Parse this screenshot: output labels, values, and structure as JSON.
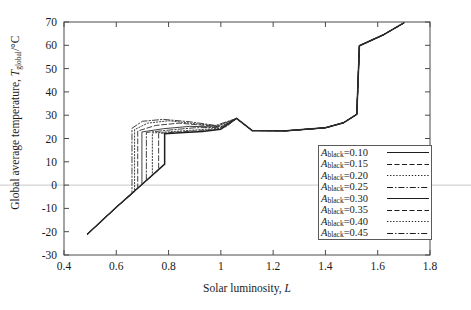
{
  "chart_data": {
    "type": "line",
    "title": "",
    "xlabel": "Solar luminosity, L",
    "ylabel": "Global average temperature, T_global/°C",
    "xlim": [
      0.4,
      1.8
    ],
    "ylim": [
      -30,
      70
    ],
    "xticks": [
      "0.4",
      "0.6",
      "0.8",
      "1",
      "1.2",
      "1.4",
      "1.6",
      "1.8"
    ],
    "xtick_values": [
      0.4,
      0.6,
      0.8,
      1.0,
      1.2,
      1.4,
      1.6,
      1.8
    ],
    "yticks": [
      "70",
      "60",
      "50",
      "40",
      "30",
      "20",
      "10",
      "0",
      "-10",
      "-20",
      "-30"
    ],
    "ytick_values": [
      70,
      60,
      50,
      40,
      30,
      20,
      10,
      0,
      -10,
      -20,
      -30
    ],
    "grid": false,
    "legend_position": "lower-right",
    "zero_reference_line": 0,
    "series": [
      {
        "name": "A_black=0.10",
        "label_prefix": "A",
        "label_subscript": "black",
        "label_value": "0.10",
        "dash": "solid",
        "jump_L": 0.785,
        "points": [
          [
            0.49,
            -21.0
          ],
          [
            0.6,
            -9.5
          ],
          [
            0.7,
            0.5
          ],
          [
            0.785,
            9.0
          ],
          [
            0.785,
            22.0
          ],
          [
            0.86,
            22.6
          ],
          [
            0.93,
            23.0
          ],
          [
            1.0,
            24.0
          ],
          [
            1.06,
            28.6
          ],
          [
            1.12,
            23.4
          ],
          [
            1.25,
            23.3
          ],
          [
            1.4,
            24.6
          ],
          [
            1.47,
            26.8
          ],
          [
            1.52,
            30.4
          ],
          [
            1.53,
            59.8
          ],
          [
            1.62,
            64.4
          ],
          [
            1.7,
            69.6
          ]
        ]
      },
      {
        "name": "A_black=0.15",
        "label_prefix": "A",
        "label_subscript": "black",
        "label_value": "0.15",
        "dash": "dashed",
        "jump_L": 0.762,
        "points": [
          [
            0.49,
            -21.0
          ],
          [
            0.6,
            -9.5
          ],
          [
            0.7,
            0.5
          ],
          [
            0.762,
            6.5
          ],
          [
            0.762,
            22.2
          ],
          [
            0.84,
            22.8
          ],
          [
            0.93,
            23.4
          ],
          [
            1.0,
            24.2
          ],
          [
            1.06,
            28.6
          ],
          [
            1.12,
            23.4
          ],
          [
            1.25,
            23.3
          ],
          [
            1.4,
            24.6
          ],
          [
            1.47,
            26.8
          ],
          [
            1.52,
            30.4
          ],
          [
            1.53,
            59.8
          ],
          [
            1.62,
            64.4
          ],
          [
            1.7,
            69.6
          ]
        ]
      },
      {
        "name": "A_black=0.20",
        "label_prefix": "A",
        "label_subscript": "black",
        "label_value": "0.20",
        "dash": "dotted",
        "jump_L": 0.738,
        "points": [
          [
            0.49,
            -21.0
          ],
          [
            0.6,
            -9.5
          ],
          [
            0.7,
            0.5
          ],
          [
            0.738,
            4.0
          ],
          [
            0.738,
            22.4
          ],
          [
            0.82,
            23.0
          ],
          [
            0.92,
            23.8
          ],
          [
            1.0,
            24.4
          ],
          [
            1.06,
            28.6
          ],
          [
            1.12,
            23.4
          ],
          [
            1.25,
            23.3
          ],
          [
            1.4,
            24.6
          ],
          [
            1.47,
            26.8
          ],
          [
            1.52,
            30.4
          ],
          [
            1.53,
            59.8
          ],
          [
            1.62,
            64.4
          ],
          [
            1.7,
            69.6
          ]
        ]
      },
      {
        "name": "A_black=0.25",
        "label_prefix": "A",
        "label_subscript": "black",
        "label_value": "0.25",
        "dash": "dashdot",
        "jump_L": 0.715,
        "points": [
          [
            0.49,
            -21.0
          ],
          [
            0.6,
            -9.5
          ],
          [
            0.7,
            0.5
          ],
          [
            0.715,
            2.0
          ],
          [
            0.715,
            22.6
          ],
          [
            0.8,
            23.6
          ],
          [
            0.9,
            24.6
          ],
          [
            1.0,
            24.8
          ],
          [
            1.06,
            28.6
          ],
          [
            1.12,
            23.4
          ],
          [
            1.25,
            23.3
          ],
          [
            1.4,
            24.6
          ],
          [
            1.47,
            26.8
          ],
          [
            1.52,
            30.4
          ],
          [
            1.53,
            59.8
          ],
          [
            1.62,
            64.4
          ],
          [
            1.7,
            69.6
          ]
        ]
      },
      {
        "name": "A_black=0.30",
        "label_prefix": "A",
        "label_subscript": "black",
        "label_value": "0.30",
        "dash": "solid",
        "jump_L": 0.698,
        "points": [
          [
            0.49,
            -21.0
          ],
          [
            0.6,
            -9.5
          ],
          [
            0.698,
            0.2
          ],
          [
            0.698,
            22.8
          ],
          [
            0.78,
            24.2
          ],
          [
            0.88,
            25.2
          ],
          [
            0.98,
            25.0
          ],
          [
            1.06,
            28.6
          ],
          [
            1.12,
            23.4
          ],
          [
            1.25,
            23.3
          ],
          [
            1.4,
            24.6
          ],
          [
            1.47,
            26.8
          ],
          [
            1.52,
            30.4
          ],
          [
            1.53,
            59.8
          ],
          [
            1.62,
            64.4
          ],
          [
            1.7,
            69.6
          ]
        ]
      },
      {
        "name": "A_black=0.35",
        "label_prefix": "A",
        "label_subscript": "black",
        "label_value": "0.35",
        "dash": "dashed",
        "jump_L": 0.682,
        "points": [
          [
            0.49,
            -21.0
          ],
          [
            0.6,
            -9.5
          ],
          [
            0.682,
            -1.5
          ],
          [
            0.682,
            23.2
          ],
          [
            0.75,
            25.6
          ],
          [
            0.84,
            26.6
          ],
          [
            0.94,
            25.6
          ],
          [
            1.02,
            25.0
          ],
          [
            1.06,
            28.6
          ],
          [
            1.12,
            23.4
          ],
          [
            1.25,
            23.3
          ],
          [
            1.4,
            24.6
          ],
          [
            1.47,
            26.8
          ],
          [
            1.52,
            30.4
          ],
          [
            1.53,
            59.8
          ],
          [
            1.62,
            64.4
          ],
          [
            1.7,
            69.6
          ]
        ]
      },
      {
        "name": "A_black=0.40",
        "label_prefix": "A",
        "label_subscript": "black",
        "label_value": "0.40",
        "dash": "dotted",
        "jump_L": 0.67,
        "points": [
          [
            0.49,
            -21.0
          ],
          [
            0.6,
            -9.5
          ],
          [
            0.67,
            -2.8
          ],
          [
            0.67,
            23.8
          ],
          [
            0.72,
            26.6
          ],
          [
            0.8,
            27.6
          ],
          [
            0.9,
            26.4
          ],
          [
            1.0,
            25.2
          ],
          [
            1.06,
            28.6
          ],
          [
            1.12,
            23.4
          ],
          [
            1.25,
            23.3
          ],
          [
            1.4,
            24.6
          ],
          [
            1.47,
            26.8
          ],
          [
            1.52,
            30.4
          ],
          [
            1.53,
            59.8
          ],
          [
            1.62,
            64.4
          ],
          [
            1.7,
            69.6
          ]
        ]
      },
      {
        "name": "A_black=0.45",
        "label_prefix": "A",
        "label_subscript": "black",
        "label_value": "0.45",
        "dash": "dashdot",
        "jump_L": 0.66,
        "points": [
          [
            0.49,
            -21.0
          ],
          [
            0.6,
            -9.5
          ],
          [
            0.66,
            -3.8
          ],
          [
            0.66,
            24.4
          ],
          [
            0.7,
            27.4
          ],
          [
            0.78,
            28.2
          ],
          [
            0.88,
            27.2
          ],
          [
            0.98,
            25.6
          ],
          [
            1.06,
            28.6
          ],
          [
            1.12,
            23.4
          ],
          [
            1.25,
            23.3
          ],
          [
            1.4,
            24.6
          ],
          [
            1.47,
            26.8
          ],
          [
            1.52,
            30.4
          ],
          [
            1.53,
            59.8
          ],
          [
            1.62,
            64.4
          ],
          [
            1.7,
            69.6
          ]
        ]
      }
    ]
  },
  "axes": {
    "x_title_text": "Solar luminosity, ",
    "x_title_symbol": "L",
    "y_title_text": "Global average temperature, ",
    "y_title_symbol": "T",
    "y_title_subscript": "global",
    "y_title_units": "/°C"
  },
  "legend": {
    "items": [
      {
        "prefix": "A",
        "subscript": "black",
        "equals": "=0.10",
        "dash": "solid"
      },
      {
        "prefix": "A",
        "subscript": "black",
        "equals": "=0.15",
        "dash": "dashed"
      },
      {
        "prefix": "A",
        "subscript": "black",
        "equals": "=0.20",
        "dash": "dotted"
      },
      {
        "prefix": "A",
        "subscript": "black",
        "equals": "=0.25",
        "dash": "dashdot"
      },
      {
        "prefix": "A",
        "subscript": "black",
        "equals": "=0.30",
        "dash": "solid"
      },
      {
        "prefix": "A",
        "subscript": "black",
        "equals": "=0.35",
        "dash": "dashed"
      },
      {
        "prefix": "A",
        "subscript": "black",
        "equals": "=0.40",
        "dash": "dotted"
      },
      {
        "prefix": "A",
        "subscript": "black",
        "equals": "=0.45",
        "dash": "dashdot"
      }
    ]
  },
  "colors": {
    "axis": "#4a4a4a",
    "curve": "#1d1d1d",
    "zero_line": "#c8c8c8",
    "background": "#ffffff"
  }
}
